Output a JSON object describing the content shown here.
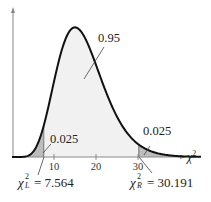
{
  "chart_data": {
    "type": "area",
    "title": "",
    "distribution": "chi-square",
    "degrees_of_freedom": 17,
    "xlabel": "χ²",
    "ylabel": "",
    "x_ticks": [
      10,
      20,
      30
    ],
    "x_range": [
      0,
      45
    ],
    "grid": false,
    "regions": [
      {
        "name": "left tail",
        "from": 0,
        "to": 7.564,
        "area": 0.025,
        "fill": "#bdbdbd"
      },
      {
        "name": "middle",
        "from": 7.564,
        "to": 30.191,
        "area": 0.95,
        "fill": "#f1f1f1"
      },
      {
        "name": "right tail",
        "from": 30.191,
        "to": 45,
        "area": 0.025,
        "fill": "#bdbdbd"
      }
    ],
    "annotations": [
      {
        "text": "0.95",
        "region": "middle"
      },
      {
        "text": "0.025",
        "region": "left tail"
      },
      {
        "text": "0.025",
        "region": "right tail"
      }
    ],
    "critical_values": [
      {
        "symbol": "χ",
        "sup": "2",
        "sub": "L",
        "value": "7.564"
      },
      {
        "symbol": "χ",
        "sup": "2",
        "sub": "R",
        "value": "30.191"
      }
    ]
  },
  "labels": {
    "middle_area": "0.95",
    "left_area": "0.025",
    "right_area": "0.025",
    "axis_chi": "χ",
    "axis_sup": "2",
    "tick_10": "10",
    "tick_20": "20",
    "tick_30": "30",
    "left_crit_symbol": "χ",
    "left_crit_sup": "2",
    "left_crit_sub": "L",
    "left_crit_value": " = 7.564",
    "right_crit_symbol": "χ",
    "right_crit_sup": "2",
    "right_crit_sub": "R",
    "right_crit_value": " = 30.191"
  },
  "colors": {
    "curve": "#111111",
    "tail_fill": "#bdbdbd",
    "body_fill": "#f1f1f1",
    "axis": "#888888"
  }
}
